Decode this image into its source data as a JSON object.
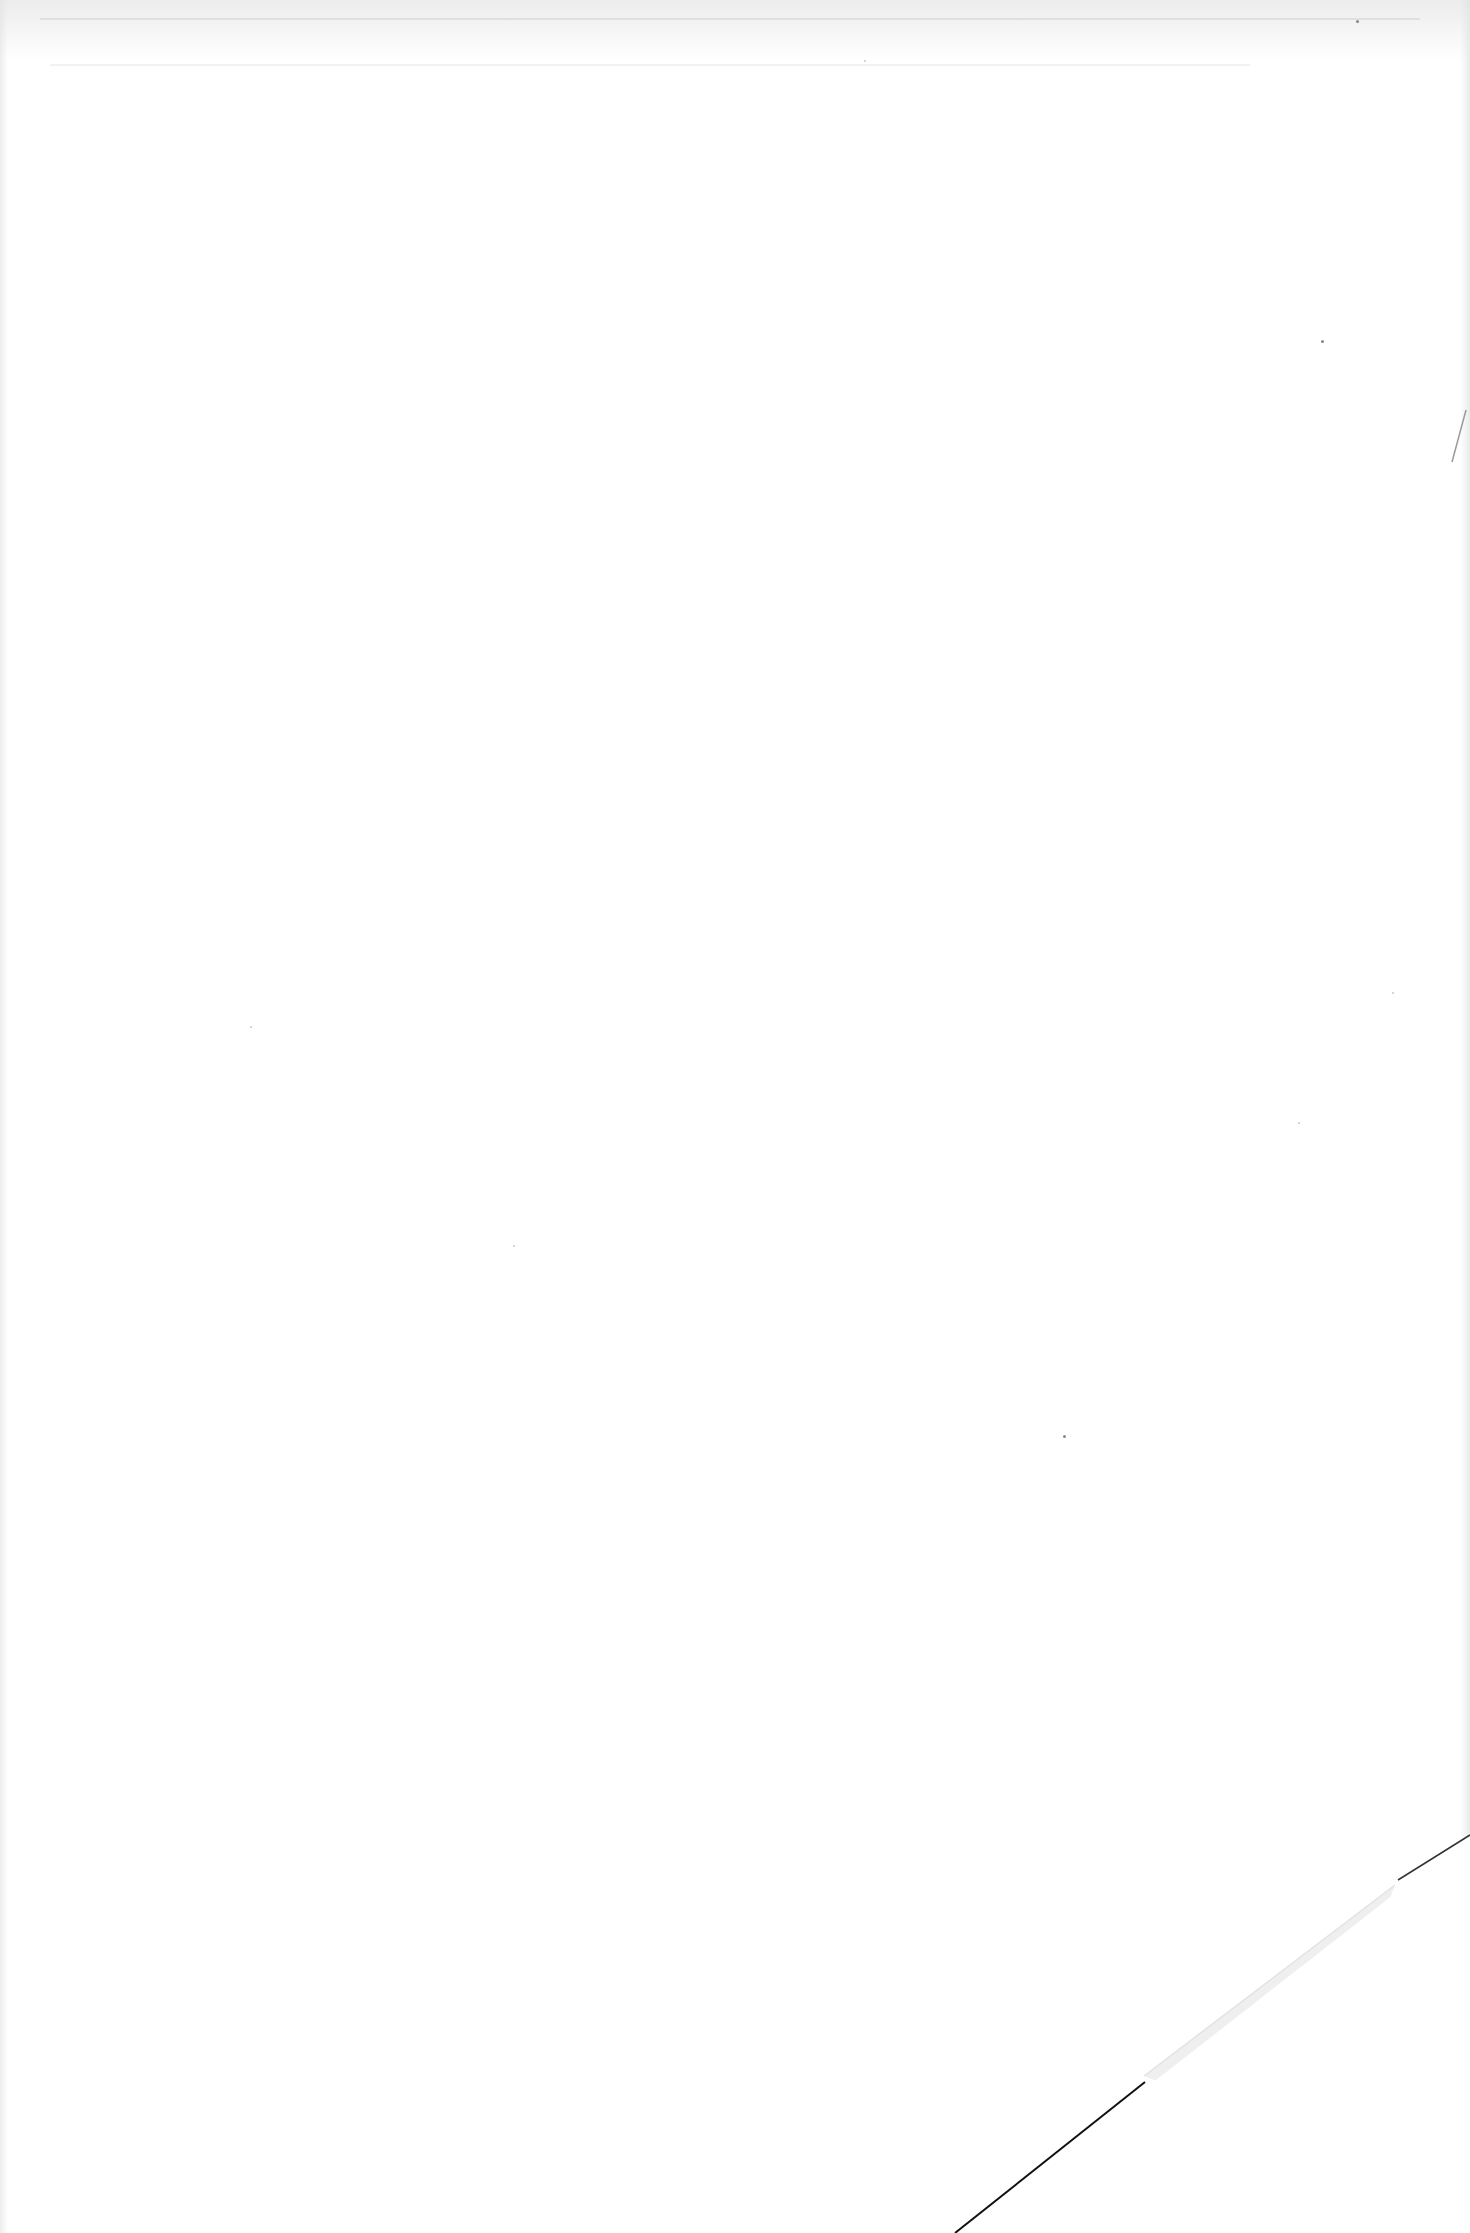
{
  "document": {
    "type": "blank-scanned-page",
    "visible_text": "",
    "page": {
      "background_color": "#ffffff",
      "fold_edge_color": "#111111",
      "fold_shadow_color": "#ececec"
    }
  }
}
